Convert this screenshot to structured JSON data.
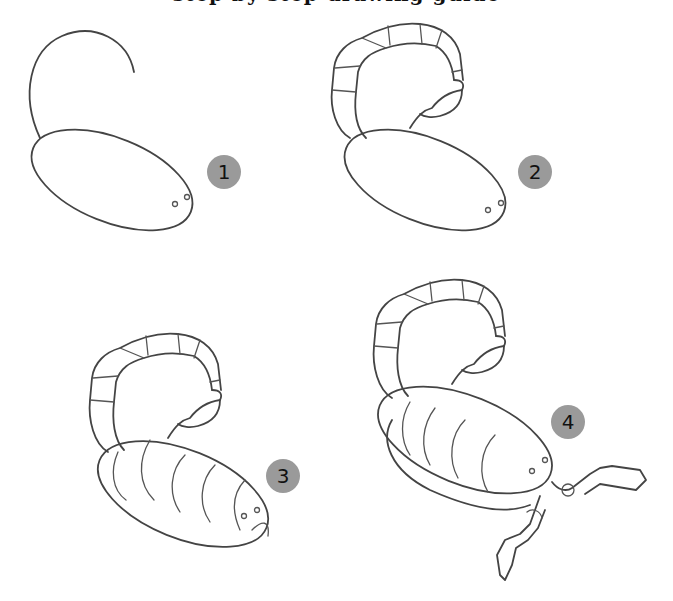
{
  "page": {
    "title_clipped": "step by step drawing guide",
    "background": "#ffffff",
    "line_color": "#444444",
    "badge_color": "#9a9a9a"
  },
  "steps": [
    {
      "number": "1",
      "caption": "body oval with curved tail guide line"
    },
    {
      "number": "2",
      "caption": "tail segments and stinger added"
    },
    {
      "number": "3",
      "caption": "body plates, eyes and head added"
    },
    {
      "number": "4",
      "caption": "claws (pincers) and lower body edge added"
    }
  ]
}
